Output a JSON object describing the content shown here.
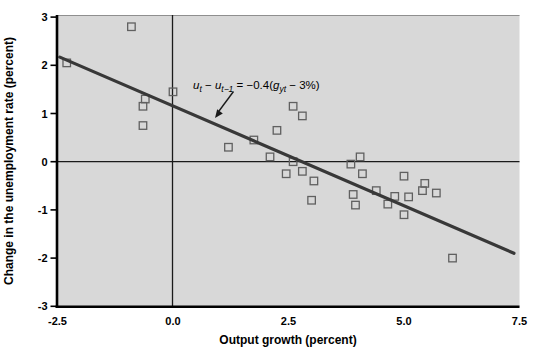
{
  "chart_data": {
    "type": "scatter",
    "title": "",
    "xlabel": "Output growth (percent)",
    "ylabel": "Change in the unemployment rate (percent)",
    "xlim": [
      -2.5,
      7.5
    ],
    "ylim": [
      -3,
      3
    ],
    "x_tick_values": [
      -2.5,
      0.0,
      2.5,
      5.0,
      7.5
    ],
    "x_tick_labels": [
      "-2.5",
      "0.0",
      "2.5",
      "5.0",
      "7.5"
    ],
    "y_tick_values": [
      3,
      2,
      1,
      0,
      -1,
      -2,
      -3
    ],
    "y_tick_labels": [
      "3",
      "2",
      "1",
      "0",
      "-1",
      "-2",
      "-3"
    ],
    "grid": false,
    "zero_reference_lines": true,
    "legend": "none",
    "marker": "open-square",
    "points": [
      [
        -2.3,
        2.05
      ],
      [
        -0.9,
        2.8
      ],
      [
        0.0,
        1.45
      ],
      [
        -0.6,
        1.3
      ],
      [
        -0.65,
        1.15
      ],
      [
        -0.65,
        0.75
      ],
      [
        1.2,
        0.3
      ],
      [
        1.75,
        0.45
      ],
      [
        2.25,
        0.65
      ],
      [
        2.6,
        1.15
      ],
      [
        2.8,
        0.95
      ],
      [
        2.1,
        0.1
      ],
      [
        2.6,
        0.0
      ],
      [
        2.45,
        -0.25
      ],
      [
        2.8,
        -0.2
      ],
      [
        3.05,
        -0.4
      ],
      [
        3.0,
        -0.8
      ],
      [
        3.85,
        -0.05
      ],
      [
        4.05,
        0.1
      ],
      [
        4.1,
        -0.25
      ],
      [
        3.9,
        -0.68
      ],
      [
        3.95,
        -0.9
      ],
      [
        4.4,
        -0.6
      ],
      [
        4.65,
        -0.88
      ],
      [
        4.8,
        -0.72
      ],
      [
        5.0,
        -0.3
      ],
      [
        5.1,
        -0.73
      ],
      [
        5.0,
        -1.1
      ],
      [
        5.4,
        -0.6
      ],
      [
        5.45,
        -0.45
      ],
      [
        5.7,
        -0.65
      ],
      [
        6.05,
        -2.0
      ]
    ],
    "regression_line": {
      "x1": -2.45,
      "y1": 2.17,
      "x2": 7.38,
      "y2": -1.9
    },
    "annotation": {
      "equation_plain": "ut − ut−1 = −0.4(gyt − 3%)",
      "segments": [
        {
          "text": "u",
          "italic": true,
          "sub": false
        },
        {
          "text": "t",
          "italic": true,
          "sub": true
        },
        {
          "text": " − ",
          "italic": false,
          "sub": false
        },
        {
          "text": "u",
          "italic": true,
          "sub": false
        },
        {
          "text": "t−1",
          "italic": true,
          "sub": true
        },
        {
          "text": " = −0.4(",
          "italic": false,
          "sub": false
        },
        {
          "text": "g",
          "italic": true,
          "sub": false
        },
        {
          "text": "yt",
          "italic": true,
          "sub": true
        },
        {
          "text": " − 3%)",
          "italic": false,
          "sub": false
        }
      ]
    },
    "colors": {
      "plot_background": "#d8d8d8",
      "regression_line": "#383838",
      "marker_stroke": "#606060",
      "axis": "#000000",
      "zero_line": "#1a1a1a",
      "text": "#000000"
    }
  }
}
